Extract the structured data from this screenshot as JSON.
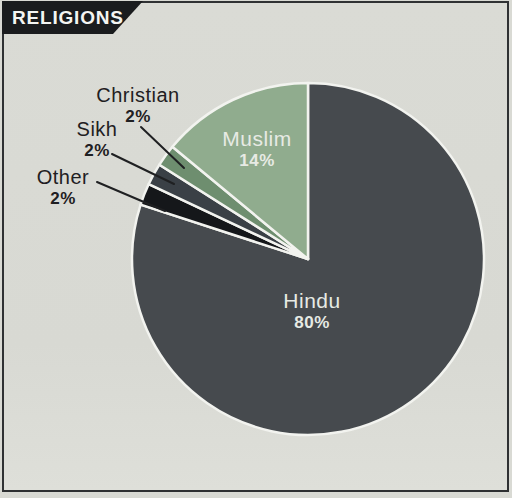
{
  "header": {
    "title": "RELIGIONS"
  },
  "colors": {
    "background": "#d9dad4",
    "frame_border": "#2f3133",
    "banner_bg": "#1a1c1e",
    "banner_text": "#f4f5f2",
    "slice_separator": "#f2f3ef",
    "inside_label_text": "#e7eae4",
    "outside_label_text": "#1f2022",
    "leader_line": "#1f2022"
  },
  "chart_data": {
    "type": "pie",
    "title": "RELIGIONS",
    "start_angle_deg": 0,
    "direction": "clockwise",
    "legend_position": "none",
    "labels_on_chart": true,
    "slices": [
      {
        "label": "Hindu",
        "value": 80,
        "pct_label": "80%",
        "color": "#464a4e",
        "label_placement": "inside"
      },
      {
        "label": "Other",
        "value": 2,
        "pct_label": "2%",
        "color": "#15171a",
        "label_placement": "outside"
      },
      {
        "label": "Sikh",
        "value": 2,
        "pct_label": "2%",
        "color": "#3a4046",
        "label_placement": "outside"
      },
      {
        "label": "Christian",
        "value": 2,
        "pct_label": "2%",
        "color": "#6e8e6f",
        "label_placement": "outside"
      },
      {
        "label": "Muslim",
        "value": 14,
        "pct_label": "14%",
        "color": "#90ac8e",
        "label_placement": "inside"
      }
    ],
    "geometry": {
      "center_x": 308,
      "center_y": 259,
      "radius": 176
    }
  }
}
